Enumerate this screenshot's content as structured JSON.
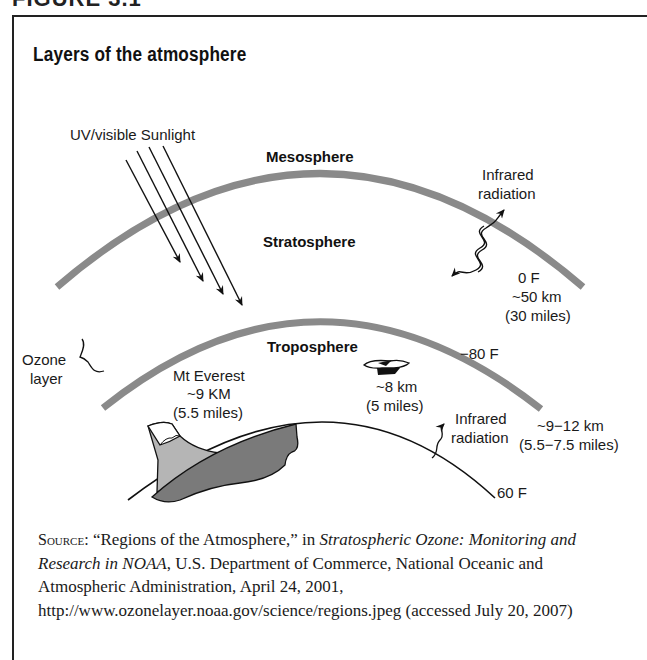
{
  "figure": {
    "header_fragment": "FIGURE 3.1",
    "title": "Layers of the atmosphere"
  },
  "diagram": {
    "layers": {
      "mesosphere": "Mesosphere",
      "stratosphere": "Stratosphere",
      "troposphere": "Troposphere"
    },
    "sunlight_label": "UV/visible Sunlight",
    "infrared_upper": [
      "Infrared",
      "radiation"
    ],
    "infrared_lower": [
      "Infrared",
      "radiation"
    ],
    "stratopause": [
      "0  F",
      "~50 km",
      "(30 miles)"
    ],
    "tropopause_temp": "−80  F",
    "tropopause_alt": [
      "~9−12 km",
      "(5.5−7.5 miles)"
    ],
    "surface_temp": "60  F",
    "ozone": [
      "Ozone",
      "layer"
    ],
    "everest": [
      "Mt Everest",
      "~9 KM",
      "(5.5 miles)"
    ],
    "plane": [
      "~8 km",
      "(5 miles)"
    ],
    "colors": {
      "layer_boundary": "#8a8a8a",
      "mountain_dark": "#7a7a7a",
      "mountain_light": "#b5b5b5",
      "ink": "#111111"
    }
  },
  "source": {
    "prefix": "Source:",
    "quote": " “Regions of the Atmosphere,” in ",
    "publication": "Stratospheric Ozone: Monitoring and Research in NOAA",
    "rest": ", U.S. Department of Commerce, National Oceanic and Atmospheric Administration, April 24, 2001, http://www.ozonelayer.noaa.gov/science/regions.jpeg (accessed July 20, 2007)"
  }
}
